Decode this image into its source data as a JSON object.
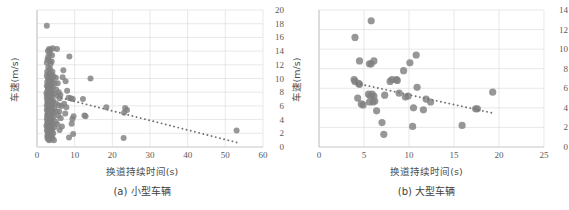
{
  "figure": {
    "panels": [
      {
        "id": "panel-a",
        "caption": "(a) 小型车辆",
        "xlabel": "换道持续时间(s)",
        "ylabel": "车速(m/s)"
      },
      {
        "id": "panel-b",
        "caption": "(b) 大型车辆",
        "xlabel": "换道持续时间(s)",
        "ylabel": "车速(m/s)"
      }
    ],
    "colors": {
      "point": "#808080",
      "gridline": "#d9d9d9",
      "axis": "#bfbfbf",
      "trend": "#737373",
      "text": "#595959",
      "background": "#ffffff"
    }
  },
  "chart_data": [
    {
      "type": "scatter",
      "title": "(a) 小型车辆",
      "xlabel": "换道持续时间(s)",
      "ylabel": "车速(m/s)",
      "xlim": [
        0,
        60
      ],
      "ylim": [
        0,
        20
      ],
      "xticks": [
        0,
        10,
        20,
        30,
        40,
        50,
        60
      ],
      "yticks": [
        0,
        2,
        4,
        6,
        8,
        10,
        12,
        14,
        16,
        18,
        20
      ],
      "grid": true,
      "legend": "none",
      "marker_size": 3.0,
      "points": [
        [
          2.6,
          17.7
        ],
        [
          3.2,
          14.3
        ],
        [
          3.6,
          14.2
        ],
        [
          4.2,
          14.4
        ],
        [
          5.3,
          14.3
        ],
        [
          2.9,
          14.0
        ],
        [
          3.4,
          13.6
        ],
        [
          4.0,
          13.4
        ],
        [
          3.0,
          13.2
        ],
        [
          8.6,
          13.2
        ],
        [
          2.8,
          12.8
        ],
        [
          3.3,
          12.6
        ],
        [
          3.9,
          12.5
        ],
        [
          2.6,
          12.3
        ],
        [
          3.6,
          12.1
        ],
        [
          7.0,
          11.2
        ],
        [
          3.0,
          11.6
        ],
        [
          3.5,
          11.4
        ],
        [
          2.7,
          11.0
        ],
        [
          4.1,
          11.0
        ],
        [
          3.1,
          10.7
        ],
        [
          3.8,
          10.6
        ],
        [
          2.6,
          10.4
        ],
        [
          4.4,
          10.3
        ],
        [
          3.3,
          10.2
        ],
        [
          5.0,
          10.1
        ],
        [
          2.9,
          10.0
        ],
        [
          3.6,
          9.9
        ],
        [
          14.2,
          10.0
        ],
        [
          3.2,
          9.7
        ],
        [
          4.0,
          9.6
        ],
        [
          2.7,
          9.5
        ],
        [
          3.5,
          9.4
        ],
        [
          4.6,
          9.3
        ],
        [
          7.6,
          9.6
        ],
        [
          3.0,
          9.1
        ],
        [
          3.8,
          9.0
        ],
        [
          2.6,
          8.9
        ],
        [
          3.3,
          8.8
        ],
        [
          4.2,
          8.7
        ],
        [
          2.9,
          8.6
        ],
        [
          3.6,
          8.5
        ],
        [
          5.1,
          8.4
        ],
        [
          3.1,
          8.3
        ],
        [
          8.0,
          8.2
        ],
        [
          2.7,
          8.1
        ],
        [
          3.9,
          8.0
        ],
        [
          3.4,
          7.9
        ],
        [
          2.5,
          7.8
        ],
        [
          4.5,
          7.8
        ],
        [
          3.0,
          7.7
        ],
        [
          3.7,
          7.6
        ],
        [
          2.8,
          7.5
        ],
        [
          5.4,
          7.5
        ],
        [
          3.2,
          7.4
        ],
        [
          4.0,
          7.3
        ],
        [
          2.6,
          7.2
        ],
        [
          3.5,
          7.1
        ],
        [
          6.0,
          7.1
        ],
        [
          8.4,
          7.2
        ],
        [
          9.0,
          7.1
        ],
        [
          9.5,
          7.0
        ],
        [
          12.2,
          7.0
        ],
        [
          3.1,
          6.9
        ],
        [
          3.8,
          6.8
        ],
        [
          2.7,
          6.7
        ],
        [
          4.3,
          6.7
        ],
        [
          3.3,
          6.6
        ],
        [
          2.9,
          6.5
        ],
        [
          3.6,
          6.4
        ],
        [
          5.0,
          6.4
        ],
        [
          3.0,
          6.3
        ],
        [
          4.1,
          6.2
        ],
        [
          2.6,
          6.1
        ],
        [
          3.4,
          6.0
        ],
        [
          5.8,
          6.1
        ],
        [
          7.8,
          5.8
        ],
        [
          3.9,
          5.9
        ],
        [
          3.1,
          5.8
        ],
        [
          2.8,
          5.7
        ],
        [
          4.6,
          5.7
        ],
        [
          3.5,
          5.6
        ],
        [
          18.4,
          5.8
        ],
        [
          3.2,
          5.5
        ],
        [
          2.6,
          5.4
        ],
        [
          4.0,
          5.4
        ],
        [
          3.7,
          5.3
        ],
        [
          23.4,
          5.7
        ],
        [
          3.0,
          5.2
        ],
        [
          5.2,
          5.2
        ],
        [
          3.4,
          5.1
        ],
        [
          2.9,
          5.0
        ],
        [
          23.9,
          5.4
        ],
        [
          4.3,
          5.0
        ],
        [
          3.6,
          4.9
        ],
        [
          3.1,
          4.8
        ],
        [
          2.7,
          4.7
        ],
        [
          23.1,
          5.0
        ],
        [
          3.9,
          4.7
        ],
        [
          3.3,
          4.6
        ],
        [
          5.6,
          4.6
        ],
        [
          2.8,
          4.5
        ],
        [
          9.7,
          4.5
        ],
        [
          4.4,
          4.4
        ],
        [
          3.5,
          4.3
        ],
        [
          3.0,
          4.2
        ],
        [
          12.6,
          4.6
        ],
        [
          12.9,
          4.5
        ],
        [
          2.6,
          4.1
        ],
        [
          3.8,
          4.1
        ],
        [
          3.2,
          4.0
        ],
        [
          4.0,
          3.9
        ],
        [
          2.9,
          3.8
        ],
        [
          9.4,
          4.1
        ],
        [
          3.6,
          3.7
        ],
        [
          3.1,
          3.6
        ],
        [
          5.0,
          3.7
        ],
        [
          2.7,
          3.5
        ],
        [
          4.2,
          3.4
        ],
        [
          3.4,
          3.3
        ],
        [
          3.0,
          3.2
        ],
        [
          5.4,
          3.3
        ],
        [
          2.5,
          3.1
        ],
        [
          3.8,
          3.0
        ],
        [
          3.3,
          2.9
        ],
        [
          4.6,
          2.9
        ],
        [
          2.8,
          2.8
        ],
        [
          9.2,
          3.4
        ],
        [
          3.5,
          2.7
        ],
        [
          3.1,
          2.6
        ],
        [
          4.0,
          2.5
        ],
        [
          2.6,
          2.4
        ],
        [
          6.0,
          2.5
        ],
        [
          3.7,
          2.3
        ],
        [
          3.2,
          2.2
        ],
        [
          2.9,
          2.1
        ],
        [
          4.3,
          2.0
        ],
        [
          9.6,
          1.9
        ],
        [
          3.4,
          1.9
        ],
        [
          3.0,
          1.8
        ],
        [
          3.9,
          1.7
        ],
        [
          2.7,
          1.6
        ],
        [
          8.5,
          1.4
        ],
        [
          3.5,
          1.5
        ],
        [
          3.1,
          1.4
        ],
        [
          4.1,
          1.3
        ],
        [
          2.8,
          1.2
        ],
        [
          23.0,
          1.3
        ],
        [
          3.6,
          1.1
        ],
        [
          3.2,
          1.0
        ],
        [
          4.5,
          1.0
        ],
        [
          53.0,
          2.4
        ],
        [
          5.8,
          8.0
        ],
        [
          6.2,
          7.6
        ],
        [
          6.5,
          6.0
        ],
        [
          5.9,
          5.2
        ],
        [
          6.3,
          4.2
        ],
        [
          6.6,
          3.0
        ],
        [
          7.2,
          6.3
        ],
        [
          7.5,
          4.9
        ],
        [
          5.5,
          9.3
        ],
        [
          6.8,
          10.2
        ]
      ],
      "trendline": {
        "style": "dotted",
        "x_start": 6.5,
        "y_start": 7.15,
        "x_end": 53.5,
        "y_end": 0.6
      }
    },
    {
      "type": "scatter",
      "title": "(b) 大型车辆",
      "xlabel": "换道持续时间(s)",
      "ylabel": "车速(m/s)",
      "xlim": [
        0,
        25
      ],
      "ylim": [
        0,
        14
      ],
      "xticks": [
        0,
        5,
        10,
        15,
        20,
        25
      ],
      "yticks": [
        0,
        2,
        4,
        6,
        8,
        10,
        12,
        14
      ],
      "grid": true,
      "legend": "none",
      "marker_size": 3.6,
      "points": [
        [
          5.8,
          12.9
        ],
        [
          4.0,
          11.2
        ],
        [
          4.5,
          8.8
        ],
        [
          5.6,
          8.5
        ],
        [
          5.8,
          8.5
        ],
        [
          6.1,
          8.8
        ],
        [
          10.8,
          9.4
        ],
        [
          10.1,
          8.6
        ],
        [
          9.4,
          7.8
        ],
        [
          3.9,
          6.9
        ],
        [
          4.0,
          6.7
        ],
        [
          4.4,
          6.5
        ],
        [
          4.5,
          6.4
        ],
        [
          8.1,
          6.9
        ],
        [
          8.6,
          6.9
        ],
        [
          7.9,
          6.7
        ],
        [
          8.7,
          6.8
        ],
        [
          9.6,
          5.1
        ],
        [
          10.9,
          6.1
        ],
        [
          9.9,
          5.2
        ],
        [
          4.3,
          5.0
        ],
        [
          5.5,
          5.4
        ],
        [
          5.7,
          5.2
        ],
        [
          5.9,
          5.4
        ],
        [
          6.1,
          5.2
        ],
        [
          7.3,
          5.3
        ],
        [
          8.9,
          5.5
        ],
        [
          11.9,
          4.9
        ],
        [
          12.4,
          4.6
        ],
        [
          4.7,
          4.4
        ],
        [
          4.9,
          4.3
        ],
        [
          5.6,
          4.6
        ],
        [
          6.0,
          4.6
        ],
        [
          6.2,
          4.7
        ],
        [
          6.4,
          3.7
        ],
        [
          10.5,
          4.0
        ],
        [
          11.6,
          3.8
        ],
        [
          7.0,
          2.5
        ],
        [
          7.2,
          1.3
        ],
        [
          10.4,
          2.1
        ],
        [
          15.9,
          2.2
        ],
        [
          17.4,
          3.9
        ],
        [
          17.6,
          3.9
        ],
        [
          19.3,
          5.6
        ]
      ],
      "trendline": {
        "style": "dotted",
        "x_start": 4.2,
        "y_start": 6.5,
        "x_end": 19.4,
        "y_end": 3.45
      }
    }
  ]
}
